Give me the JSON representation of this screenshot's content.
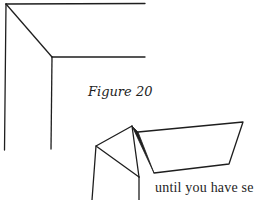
{
  "figure": {
    "caption": "Figure 20",
    "top_drawing": "corner-frame-miter-fold",
    "bottom_drawing": "folded-paper-corner"
  },
  "body_text": {
    "fragment": "until you have se"
  },
  "colors": {
    "ink": "#1e1e1e",
    "paper": "#ffffff"
  }
}
